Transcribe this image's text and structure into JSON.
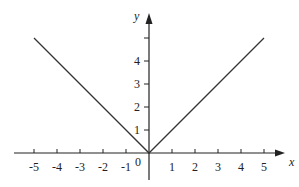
{
  "chart_data": {
    "type": "line",
    "title": "",
    "function": "y = |x|",
    "xlabel": "x",
    "ylabel": "y",
    "xlim": [
      -5,
      5
    ],
    "ylim": [
      0,
      5
    ],
    "grid": false,
    "legend": null,
    "x_ticks": [
      -5,
      -4,
      -3,
      -2,
      -1,
      1,
      2,
      3,
      4,
      5
    ],
    "x_tick_labels": [
      "-5",
      "-4",
      "-3",
      "-2",
      "-1",
      "1",
      "2",
      "3",
      "4",
      "5"
    ],
    "y_ticks": [
      1,
      2,
      3,
      4,
      5
    ],
    "y_tick_labels": [
      "1",
      "2",
      "3",
      "4",
      ""
    ],
    "origin_label": "0",
    "series": [
      {
        "name": "y = |x|",
        "x": [
          -5,
          0,
          5
        ],
        "y": [
          5,
          0,
          5
        ],
        "color": "#333333"
      }
    ]
  },
  "layout": {
    "origin_px": [
      149,
      153
    ],
    "unit_px": 23,
    "axis_color": "#222222",
    "line_color": "#333333"
  }
}
